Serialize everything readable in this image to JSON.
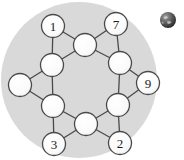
{
  "canvas": {
    "width": 184,
    "height": 160,
    "background_color": "#ffffff"
  },
  "backdrop": {
    "shape": "circle",
    "fill_color": "#d9d9d9",
    "cx": 79,
    "cy": 80,
    "r": 78
  },
  "globe_icon": {
    "name": "globe-icon",
    "cx": 168,
    "cy": 20,
    "r": 8,
    "fill_color": "#4d4d4d",
    "highlight_color": "#b3b3b3",
    "shadow_color": "#262626"
  },
  "graph": {
    "title": "",
    "node_fill_color": "#fbfbfb",
    "node_stroke_color": "#4a4a4a",
    "edge_color": "#4a4a4a",
    "node_radius": 11.5,
    "nodes": [
      {
        "id": "n1",
        "label": "1",
        "x": 53,
        "y": 26,
        "labeled": true
      },
      {
        "id": "n2",
        "label": "7",
        "x": 116,
        "y": 24,
        "labeled": true
      },
      {
        "id": "n3",
        "label": "",
        "x": 85,
        "y": 45,
        "labeled": false
      },
      {
        "id": "n4",
        "label": "",
        "x": 52,
        "y": 65,
        "labeled": false
      },
      {
        "id": "n5",
        "label": "",
        "x": 120,
        "y": 63,
        "labeled": false
      },
      {
        "id": "n6",
        "label": "",
        "x": 20,
        "y": 85,
        "labeled": false
      },
      {
        "id": "n7",
        "label": "9",
        "x": 148,
        "y": 83,
        "labeled": true
      },
      {
        "id": "n8",
        "label": "",
        "x": 53,
        "y": 106,
        "labeled": false
      },
      {
        "id": "n9",
        "label": "",
        "x": 118,
        "y": 105,
        "labeled": false
      },
      {
        "id": "n10",
        "label": "",
        "x": 86,
        "y": 124,
        "labeled": false
      },
      {
        "id": "n11",
        "label": "3",
        "x": 54,
        "y": 144,
        "labeled": true
      },
      {
        "id": "n12",
        "label": "2",
        "x": 120,
        "y": 143,
        "labeled": true
      }
    ],
    "edges": [
      {
        "from": "n1",
        "to": "n3"
      },
      {
        "from": "n1",
        "to": "n4"
      },
      {
        "from": "n2",
        "to": "n3"
      },
      {
        "from": "n2",
        "to": "n5"
      },
      {
        "from": "n3",
        "to": "n4"
      },
      {
        "from": "n3",
        "to": "n5"
      },
      {
        "from": "n4",
        "to": "n6"
      },
      {
        "from": "n4",
        "to": "n8"
      },
      {
        "from": "n5",
        "to": "n7"
      },
      {
        "from": "n5",
        "to": "n9"
      },
      {
        "from": "n6",
        "to": "n8"
      },
      {
        "from": "n7",
        "to": "n9"
      },
      {
        "from": "n8",
        "to": "n10"
      },
      {
        "from": "n8",
        "to": "n11"
      },
      {
        "from": "n9",
        "to": "n10"
      },
      {
        "from": "n9",
        "to": "n12"
      },
      {
        "from": "n10",
        "to": "n11"
      },
      {
        "from": "n10",
        "to": "n12"
      }
    ]
  }
}
